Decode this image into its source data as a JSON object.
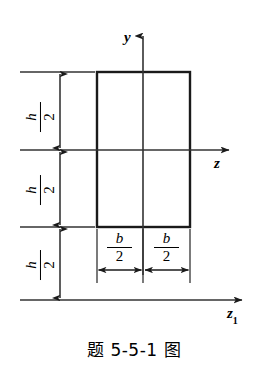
{
  "figure": {
    "caption": "题 5-5-1 图",
    "title_cn": "题 5-5-1 图",
    "axes": [
      {
        "id": "y",
        "label": "y",
        "subscript": "",
        "orientation": "vertical",
        "direction": "up"
      },
      {
        "id": "z",
        "label": "z",
        "subscript": "",
        "orientation": "horizontal",
        "direction": "right"
      },
      {
        "id": "z1",
        "label": "z",
        "subscript": "1",
        "orientation": "horizontal",
        "direction": "right"
      }
    ],
    "dimensions": {
      "height_labels": [
        {
          "id": "h-upper",
          "numerator": "h",
          "denominator": "2"
        },
        {
          "id": "h-lower",
          "numerator": "h",
          "denominator": "2"
        },
        {
          "id": "h-offset",
          "numerator": "h",
          "denominator": "2"
        }
      ],
      "width_labels": [
        {
          "id": "b-left",
          "numerator": "b",
          "denominator": "2"
        },
        {
          "id": "b-right",
          "numerator": "b",
          "denominator": "2"
        }
      ]
    },
    "shape": {
      "type": "rectangle",
      "description": "rectangular cross-section of width b and height h"
    },
    "colors": {
      "stroke": "#1a1a1a",
      "thin_stroke": "#333333",
      "background": "#ffffff",
      "text": "#000000"
    }
  }
}
